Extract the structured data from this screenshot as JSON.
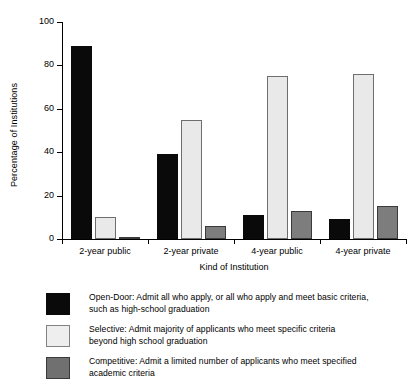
{
  "chart_data": {
    "type": "bar",
    "title": "",
    "xlabel": "Kind of Institution",
    "ylabel": "Percentage of Institutions",
    "categories": [
      "2-year public",
      "2-year private",
      "4-year public",
      "4-year private"
    ],
    "ylim": [
      0,
      100
    ],
    "yticks": [
      0,
      20,
      40,
      60,
      80,
      100
    ],
    "ytick_labels": [
      "0",
      "20",
      "40",
      "60",
      "80",
      "100"
    ],
    "grid": false,
    "legend_position": "below",
    "series": [
      {
        "name": "Open-Door",
        "color": "#0a0a0a",
        "values": [
          89,
          39,
          11,
          9
        ]
      },
      {
        "name": "Selective",
        "color": "#e9e9e9",
        "values": [
          10,
          55,
          75,
          76
        ]
      },
      {
        "name": "Competitive",
        "color": "#7d7d7d",
        "values": [
          1,
          6,
          13,
          15
        ]
      }
    ]
  },
  "legend": {
    "items": [
      {
        "key": "open",
        "swatch_name": "legend-swatch-open-door",
        "line1": "Open-Door: Admit all who apply, or all who apply and meet basic criteria,",
        "line2": "such as high-school graduation"
      },
      {
        "key": "sel",
        "swatch_name": "legend-swatch-selective",
        "line1": "Selective: Admit majority of applicants who meet specific criteria",
        "line2": "beyond high school graduation"
      },
      {
        "key": "comp",
        "swatch_name": "legend-swatch-competitive",
        "line1": "Competitive: Admit a limited number of applicants who meet specified",
        "line2": "academic criteria"
      }
    ]
  }
}
